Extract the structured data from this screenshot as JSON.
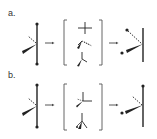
{
  "figure": {
    "panels": [
      {
        "label": "a.",
        "reactant": "tetrahedral center: vertical bond with two dotted substituents (top, bottom), wedge bond lower-left, dashed bond upper-left",
        "intermediates": [
          "cross / planar arrangement",
          "wedge-dash pair",
          "Y-shaped pyramidal arrangement"
        ],
        "product": "tetrahedral center: vertical bond, dotted substituents moved to left (upper dashed, lower wedge)"
      },
      {
        "label": "b.",
        "reactant": "tetrahedral center: vertical bond with two dotted substituents (top, bottom), wedge bond lower-left, dashed bond upper-left",
        "intermediates": [
          "three-bond star arrangement",
          "Y-shaped pyramidal arrangement with wedge"
        ],
        "product": "tetrahedral center: vertical bond with dot on top, dashed bond upper-left, wedge to dotted substituent lower-left"
      }
    ],
    "arrow_symbol": "→",
    "colors": {
      "ink": "#222222",
      "bracket": "#555555",
      "background": "#ffffff"
    }
  }
}
